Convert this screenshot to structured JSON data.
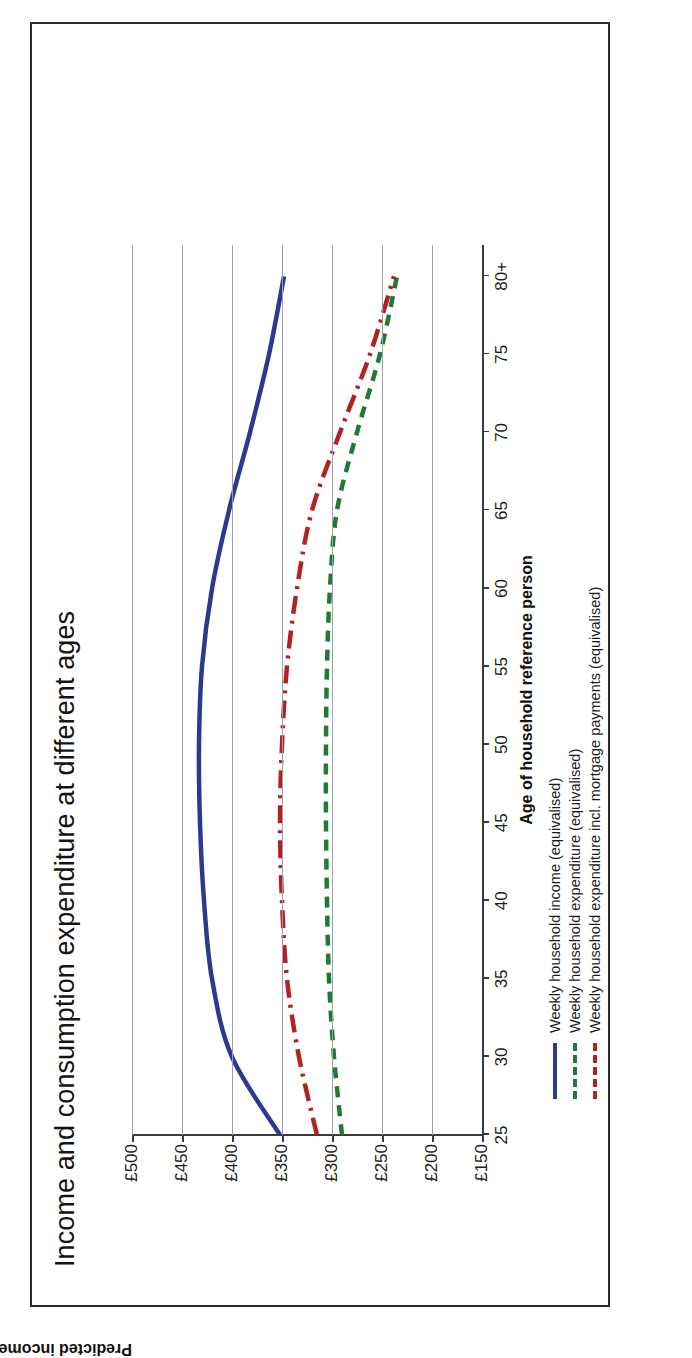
{
  "chart_data": {
    "type": "line",
    "title": "Income and consumption expenditure at different ages",
    "xlabel": "Age of household reference person",
    "ylabel": "Predicted income and consumption (2013 prices)",
    "grid": true,
    "legend_position": "below-plot-left",
    "xlim": [
      25,
      82
    ],
    "ylim": [
      150,
      500
    ],
    "x_ticks": [
      "25",
      "30",
      "35",
      "40",
      "45",
      "50",
      "55",
      "60",
      "65",
      "70",
      "75",
      "80+"
    ],
    "x_tick_values": [
      25,
      30,
      35,
      40,
      45,
      50,
      55,
      60,
      65,
      70,
      75,
      80
    ],
    "y_ticks": [
      "£500",
      "£450",
      "£400",
      "£350",
      "£300",
      "£250",
      "£200",
      "£150"
    ],
    "y_tick_values": [
      500,
      450,
      400,
      350,
      300,
      250,
      200,
      150
    ],
    "x": [
      25,
      30,
      35,
      40,
      45,
      50,
      55,
      60,
      65,
      70,
      75,
      80
    ],
    "series": [
      {
        "name": "Weekly household income (equivalised)",
        "color": "#2b3a8f",
        "style": "solid",
        "values": [
          352,
          400,
          420,
          428,
          432,
          433,
          430,
          420,
          403,
          382,
          363,
          348
        ]
      },
      {
        "name": "Weekly household expenditure (equivalised)",
        "color": "#1f7a33",
        "style": "dashed",
        "values": [
          290,
          298,
          303,
          305,
          306,
          306,
          305,
          302,
          295,
          275,
          252,
          235
        ]
      },
      {
        "name": "Weekly household expenditure incl. mortgage payments (equivalised)",
        "color": "#b22222",
        "style": "dash-dot",
        "values": [
          315,
          333,
          345,
          350,
          352,
          350,
          345,
          335,
          320,
          292,
          262,
          238
        ]
      }
    ]
  },
  "legend": {
    "items": [
      {
        "label": "Weekly household income (equivalised)",
        "color": "#2b3a8f",
        "style": "solid"
      },
      {
        "label": "Weekly household expenditure (equivalised)",
        "color": "#1f7a33",
        "style": "dashed"
      },
      {
        "label": "Weekly household expenditure incl. mortgage payments (equivalised)",
        "color": "#b22222",
        "style": "dash-dot"
      }
    ]
  }
}
